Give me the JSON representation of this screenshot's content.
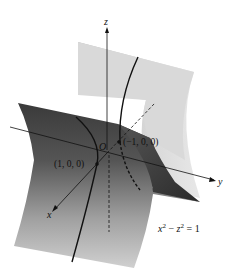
{
  "figure": {
    "type": "3d-surface-diagram",
    "surface": "hyperbolic cylinder",
    "equation": {
      "text": "x² − z² = 1",
      "x": "x",
      "x_exp": "2",
      "minus": " − ",
      "z": "z",
      "z_exp": "2",
      "rhs": " = 1"
    },
    "axes": {
      "x_label": "x",
      "y_label": "y",
      "z_label": "z"
    },
    "origin_label": "O",
    "points": [
      {
        "label": "(1, 0, 0)"
      },
      {
        "label": "(−1, 0, 0)"
      }
    ],
    "colors": {
      "back_sheet_light": "#e6e6e6",
      "back_sheet_dark": "#a8a8a8",
      "front_sheet_dark": "#4a4a4a",
      "front_sheet_light": "#c8c8c8",
      "line": "#111111",
      "background": "#ffffff"
    }
  }
}
